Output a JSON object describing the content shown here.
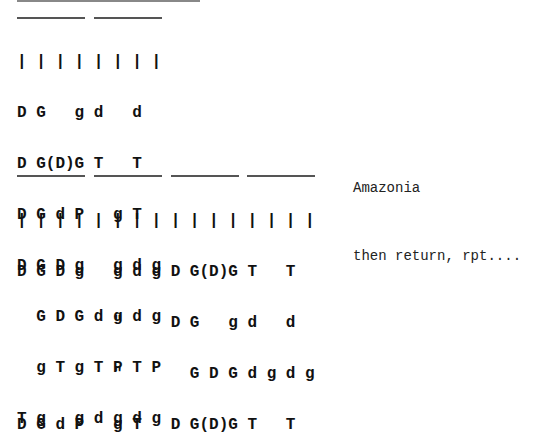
{
  "document": {
    "section1": {
      "ticks": "| | | | | | | |",
      "rows": [
        "D G   g d   d",
        "D G(D)G T   T",
        "D G d P   g T",
        "D G D g   g d g",
        "  G D G d g d g",
        "  g T g T P T P",
        "T g   g d g d g"
      ]
    },
    "section2": {
      "ticks": "| | | | | | | | | | | | | | | |",
      "rows": [
        "D G D g   g d g D G(D)G T   T",
        "          \"     D G   g d   d",
        "          \"       G D G d g d g",
        "D G d P   g T   D G(D)G T   T"
      ],
      "labels": {
        "title": "Amazonia",
        "footer": "then return, rpt...."
      }
    }
  }
}
